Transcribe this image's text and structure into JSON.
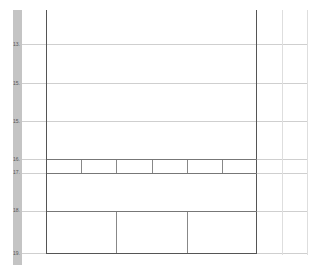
{
  "ruler": {
    "labels": [
      {
        "text": "13.",
        "y": 44
      },
      {
        "text": "15.",
        "y": 83
      },
      {
        "text": "15.",
        "y": 121
      },
      {
        "text": "16.",
        "y": 159
      },
      {
        "text": "17.",
        "y": 172
      },
      {
        "text": "18.",
        "y": 210
      },
      {
        "text": "19.",
        "y": 252
      }
    ]
  },
  "table": {
    "row_six_cells": [
      "",
      "",
      "",
      "",
      "",
      ""
    ],
    "row_three_cells": [
      "",
      "",
      ""
    ]
  }
}
